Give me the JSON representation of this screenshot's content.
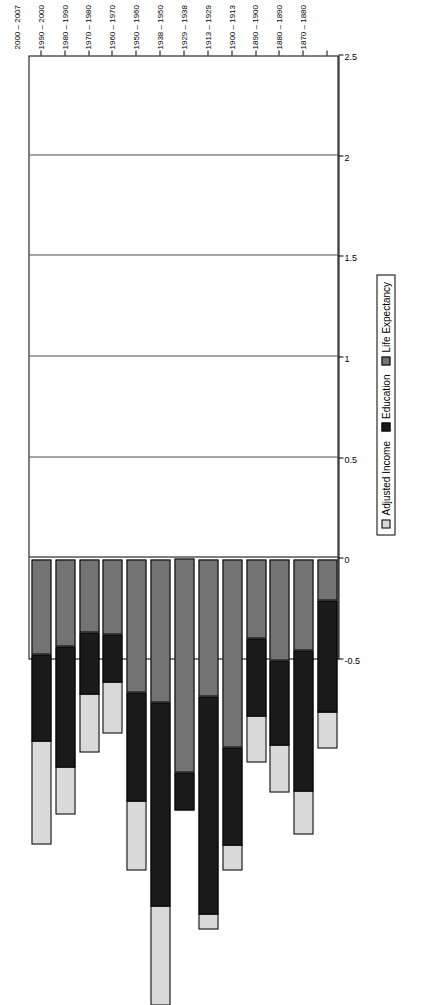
{
  "chart_data": {
    "type": "bar",
    "orientation": "horizontal-stacked",
    "title": "",
    "xlabel": "",
    "ylabel": "",
    "xlim": [
      -0.5,
      2.5
    ],
    "xticks": [
      "-0.5",
      "0",
      "0.5",
      "1",
      "1.5",
      "2",
      "2.5"
    ],
    "grid": true,
    "legend_position": "bottom-right",
    "categories": [
      "1870 – 1880",
      "1880 – 1890",
      "1890 – 1900",
      "1900 – 1913",
      "1913 – 1929",
      "1929 – 1938",
      "1938 – 1950",
      "1950 – 1960",
      "1960 – 1970",
      "1970 – 1980",
      "1980 – 1990",
      "1990 – 2000",
      "2000 – 2007"
    ],
    "series": [
      {
        "name": "Life Expectancy",
        "color": "#737373",
        "values": [
          0.2,
          0.45,
          0.5,
          0.39,
          0.93,
          0.68,
          1.06,
          0.71,
          0.66,
          0.37,
          0.36,
          0.43,
          0.47
        ]
      },
      {
        "name": "Education",
        "color": "#1a1a1a",
        "values": [
          0.56,
          0.7,
          0.42,
          0.39,
          0.49,
          1.08,
          0.19,
          1.01,
          0.54,
          0.24,
          0.31,
          0.6,
          0.43
        ]
      },
      {
        "name": "Adjusted Income",
        "color": "#d9d9d9",
        "values": [
          0.18,
          0.22,
          0.24,
          0.23,
          0.13,
          0.08,
          0.0,
          0.5,
          0.35,
          0.26,
          0.29,
          0.24,
          0.52
        ]
      }
    ],
    "totals": [
      0.94,
      1.37,
      1.16,
      1.01,
      1.55,
      1.84,
      1.25,
      2.22,
      1.55,
      0.87,
      0.96,
      1.27,
      1.42
    ]
  },
  "legend": {
    "entries": [
      {
        "label": "Adjusted Income",
        "color": "#d9d9d9"
      },
      {
        "label": "Education",
        "color": "#1a1a1a"
      },
      {
        "label": "Life Expectancy",
        "color": "#737373"
      }
    ]
  }
}
